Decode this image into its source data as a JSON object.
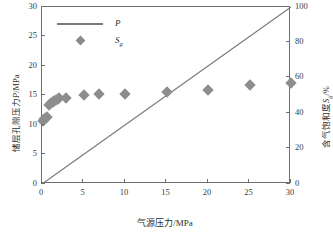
{
  "chart_data": {
    "type": "scatter",
    "title": "",
    "xlabel": "气源压力/MPa",
    "ylabel_left": "储层孔隙压力P/MPa",
    "ylabel_right": "含气饱和度Sg/%",
    "xlim": [
      0,
      30
    ],
    "ylim_left": [
      0,
      30
    ],
    "ylim_right": [
      0,
      100
    ],
    "grid": false,
    "legend_position": "top-left",
    "x_ticks": [
      "0",
      "5",
      "10",
      "15",
      "20",
      "25",
      "30"
    ],
    "x_tick_values": [
      0,
      5,
      10,
      15,
      20,
      25,
      30
    ],
    "y_left_ticks": [
      "0",
      "5",
      "10",
      "15",
      "20",
      "25",
      "30"
    ],
    "y_left_tick_values": [
      0,
      5,
      10,
      15,
      20,
      25,
      30
    ],
    "y_right_ticks": [
      "0",
      "20",
      "40",
      "60",
      "80",
      "100"
    ],
    "y_right_tick_values": [
      0,
      20,
      40,
      60,
      80,
      100
    ],
    "series": [
      {
        "name": "P",
        "kind": "line",
        "axis": "left",
        "color": "#7b7b7b",
        "x": [
          0,
          30
        ],
        "values": [
          0,
          30
        ]
      },
      {
        "name": "Sg",
        "kind": "scatter",
        "axis": "right",
        "color": "#8d8d8d",
        "marker": "diamond",
        "x": [
          0.1,
          0.25,
          0.45,
          0.6,
          0.9,
          1.1,
          1.3,
          1.5,
          1.7,
          1.9,
          2.1,
          2.9,
          5.0,
          6.9,
          10.0,
          15.0,
          20.0,
          25.0,
          30.0
        ],
        "values": [
          35.5,
          36.5,
          37.5,
          38.0,
          44.5,
          45.5,
          46.2,
          46.8,
          47.4,
          48.0,
          48.4,
          48.5,
          50.3,
          50.6,
          51.0,
          51.8,
          53.0,
          56.2,
          57.0
        ]
      }
    ]
  },
  "legend": {
    "entries": [
      {
        "label": "P",
        "sub": "",
        "type": "line"
      },
      {
        "label": "S",
        "sub": "g",
        "type": "marker"
      }
    ]
  },
  "axis_titles": {
    "x": "气源压力/MPa",
    "y_left_cn": "储层孔隙压力",
    "y_left_sym": "P",
    "y_left_unit": "/MPa",
    "y_right_cn": "含气饱和度",
    "y_right_sym": "S",
    "y_right_sub": "g",
    "y_right_unit": "/%"
  },
  "colors": {
    "line": "#7b7b7b",
    "marker": "#8d8d8d",
    "axis": "#6e6e6e",
    "text": "#2e2e2e",
    "background": "#ffffff"
  }
}
